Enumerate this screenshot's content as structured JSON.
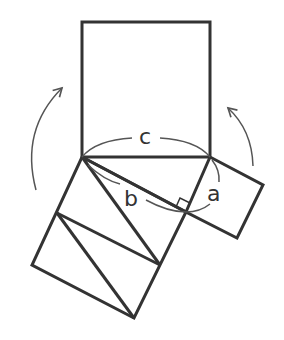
{
  "diagram": {
    "type": "pythagorean-proof",
    "labels": {
      "hypotenuse": "c",
      "leg_long": "b",
      "leg_short": "a"
    },
    "colors": {
      "stroke": "#333333",
      "arc": "#555555",
      "background": "#ffffff"
    },
    "elements": [
      {
        "name": "square-c",
        "description": "square on hypotenuse c"
      },
      {
        "name": "square-b",
        "description": "square on leg b, cut into triangles"
      },
      {
        "name": "square-a",
        "description": "square on leg a"
      },
      {
        "name": "right-triangle",
        "description": "right triangle with legs a, b and hypotenuse c"
      },
      {
        "name": "rotation-arrow-left",
        "description": "curved arrow indicating rotation"
      },
      {
        "name": "rotation-arrow-right",
        "description": "curved arrow indicating rotation"
      }
    ]
  }
}
